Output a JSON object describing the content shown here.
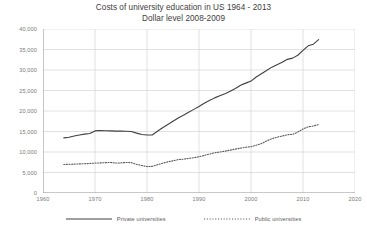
{
  "chart_data": {
    "type": "line",
    "title": "Costs of university education in US 1964 - 2013",
    "subtitle": "Dollar level 2008-2009",
    "xlabel": "",
    "ylabel": "",
    "xlim": [
      1960,
      2020
    ],
    "ylim": [
      0,
      40000
    ],
    "grid": true,
    "legend_position": "bottom",
    "xticks": [
      "1960",
      "1970",
      "1980",
      "1990",
      "2000",
      "2010",
      "2020"
    ],
    "xtick_values": [
      1960,
      1970,
      1980,
      1990,
      2000,
      2010,
      2020
    ],
    "yticks": [
      "0",
      "5,000",
      "10,000",
      "15,000",
      "20,000",
      "25,000",
      "30,000",
      "35,000",
      "40,000"
    ],
    "ytick_values": [
      0,
      5000,
      10000,
      15000,
      20000,
      25000,
      30000,
      35000,
      40000
    ],
    "x": [
      1964,
      1965,
      1966,
      1967,
      1968,
      1969,
      1970,
      1971,
      1972,
      1973,
      1974,
      1975,
      1976,
      1977,
      1978,
      1979,
      1980,
      1981,
      1982,
      1983,
      1984,
      1985,
      1986,
      1987,
      1988,
      1989,
      1990,
      1991,
      1992,
      1993,
      1994,
      1995,
      1996,
      1997,
      1998,
      1999,
      2000,
      2001,
      2002,
      2003,
      2004,
      2005,
      2006,
      2007,
      2008,
      2009,
      2010,
      2011,
      2012,
      2013
    ],
    "series": [
      {
        "name": "Private universities",
        "style": "solid",
        "color": "#404040",
        "values": [
          13450,
          13600,
          13900,
          14150,
          14350,
          14500,
          15150,
          15250,
          15200,
          15150,
          15100,
          15100,
          15050,
          15000,
          14600,
          14250,
          14150,
          14150,
          15050,
          15900,
          16700,
          17500,
          18300,
          18950,
          19700,
          20400,
          21100,
          21900,
          22550,
          23200,
          23700,
          24200,
          24800,
          25500,
          26300,
          26800,
          27300,
          28300,
          29100,
          29900,
          30700,
          31300,
          31900,
          32600,
          32900,
          33600,
          34800,
          35900,
          36300,
          37400
        ]
      },
      {
        "name": "Public universities",
        "style": "dotted",
        "color": "#595959",
        "values": [
          6950,
          7000,
          7050,
          7100,
          7150,
          7200,
          7300,
          7350,
          7400,
          7450,
          7300,
          7350,
          7450,
          7400,
          7000,
          6700,
          6450,
          6500,
          6900,
          7250,
          7600,
          7850,
          8150,
          8250,
          8450,
          8600,
          8850,
          9150,
          9500,
          9800,
          10000,
          10200,
          10450,
          10700,
          10950,
          11150,
          11300,
          11650,
          12050,
          12700,
          13250,
          13600,
          13900,
          14200,
          14300,
          14850,
          15600,
          16150,
          16350,
          16700
        ]
      }
    ]
  },
  "legend": {
    "entries": [
      {
        "label": "Private universities",
        "style": "solid"
      },
      {
        "label": "Public universities",
        "style": "dotted"
      }
    ]
  }
}
